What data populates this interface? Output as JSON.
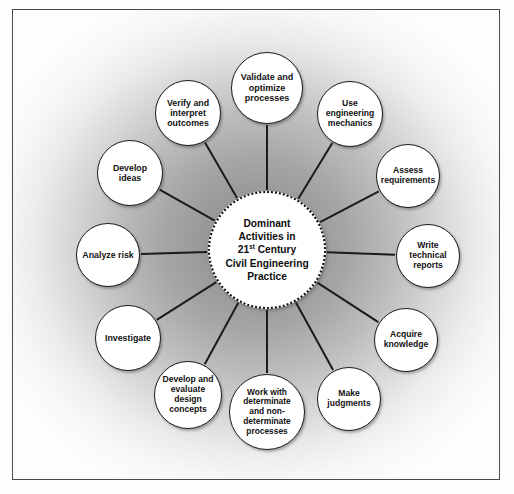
{
  "diagram": {
    "title_center_line1": "Dominant",
    "title_center_line2": "Activities in",
    "title_center_line3_pre": "21",
    "title_center_line3_sup": "st",
    "title_center_line3_post": " Century",
    "title_center_line4": "Civil Engineering",
    "title_center_line5": "Practice",
    "center_full_text": "Dominant Activities in 21st Century Civil Engineering Practice",
    "colors": {
      "node_fill": "#ffffff",
      "node_border": "#1b1b1b",
      "connector": "#1b1b1b",
      "hub_border": "#121212",
      "text": "#121212",
      "frame_border": "#4a4a4a",
      "background_center": "#8f8f8f",
      "background_edge": "#fdfdfd"
    },
    "nodes": [
      {
        "id": "validate-optimize-processes",
        "label": "Validate and\noptimize\nprocesses",
        "cx": 254,
        "cy": 78,
        "r": 36,
        "font_size": 9.0
      },
      {
        "id": "use-engineering-mechanics",
        "label": "Use\nengineering\nmechanics",
        "cx": 337,
        "cy": 104,
        "r": 33,
        "font_size": 8.6
      },
      {
        "id": "assess-requirements",
        "label": "Assess\nrequirements",
        "cx": 395,
        "cy": 166,
        "r": 32,
        "font_size": 8.6
      },
      {
        "id": "write-technical-reports",
        "label": "Write\ntechnical\nreports",
        "cx": 415,
        "cy": 246,
        "r": 32,
        "font_size": 8.6
      },
      {
        "id": "acquire-knowledge",
        "label": "Acquire\nknowledge",
        "cx": 393,
        "cy": 330,
        "r": 32,
        "font_size": 8.6
      },
      {
        "id": "make-judgments",
        "label": "Make\njudgments",
        "cx": 336,
        "cy": 389,
        "r": 32,
        "font_size": 8.6
      },
      {
        "id": "work-with-determinate-processes",
        "label": "Work with\ndeterminate\nand non-\ndeterminate\nprocesses",
        "cx": 254,
        "cy": 402,
        "r": 38,
        "font_size": 8.4
      },
      {
        "id": "develop-evaluate-design-concepts",
        "label": "Develop and\nevaluate\ndesign\nconcepts",
        "cx": 175,
        "cy": 385,
        "r": 34,
        "font_size": 8.6
      },
      {
        "id": "investigate",
        "label": "Investigate",
        "cx": 115,
        "cy": 328,
        "r": 33,
        "font_size": 8.8
      },
      {
        "id": "analyze-risk",
        "label": "Analyze risk",
        "cx": 95,
        "cy": 245,
        "r": 32,
        "font_size": 8.8
      },
      {
        "id": "develop-ideas",
        "label": "Develop\nideas",
        "cx": 117,
        "cy": 163,
        "r": 33,
        "font_size": 8.8
      },
      {
        "id": "verify-interpret-outcomes",
        "label": "Verify and\ninterpret\noutcomes",
        "cx": 175,
        "cy": 103,
        "r": 33,
        "font_size": 8.8
      }
    ],
    "hub": {
      "cx": 254,
      "cy": 240,
      "r": 59,
      "font_size": 10.2
    }
  }
}
